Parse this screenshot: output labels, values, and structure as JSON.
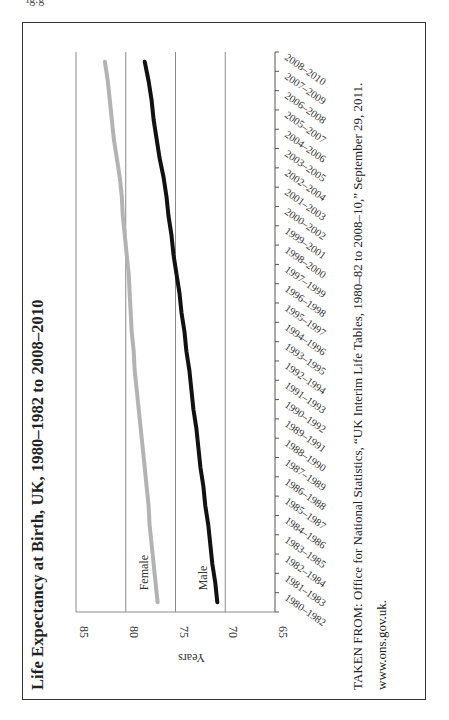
{
  "title": "Life Expectancy at Birth, UK, 1980–1982 to 2008–2010",
  "source": {
    "line1": "TAKEN FROM: Office for National Statistics, “UK Interim Life Tables, 1980–82 to 2008–10,” September 29, 2011.",
    "line2": "www.ons.gov.uk."
  },
  "top_fragment": "ig.g",
  "colors": {
    "female": "#b3b3b3",
    "male": "#111111",
    "grid": "#8a8a8a",
    "frame": "#333333"
  },
  "chart_data": {
    "type": "line",
    "title": "Life Expectancy at Birth, UK, 1980–1982 to 2008–2010",
    "xlabel": "",
    "ylabel": "Years",
    "ylim": [
      65,
      85
    ],
    "yticks": [
      65,
      70,
      75,
      80,
      85
    ],
    "grid": true,
    "orientation": "rotated -90° (x-axis runs vertically, years axis horizontal)",
    "legend": "inline labels at series start (Female, Male)",
    "categories": [
      "1980–1982",
      "1981–1983",
      "1982–1984",
      "1983–1985",
      "1984–1986",
      "1985–1987",
      "1986–1988",
      "1987–1989",
      "1988–1990",
      "1989–1991",
      "1990–1992",
      "1991–1993",
      "1992–1994",
      "1993–1995",
      "1994–1996",
      "1995–1997",
      "1996–1998",
      "1997–1999",
      "1998–2000",
      "1999–2001",
      "2000–2002",
      "2001–2003",
      "2002–2004",
      "2003–2005",
      "2004–2006",
      "2005–2007",
      "2006–2008",
      "2007–2009",
      "2008–2010"
    ],
    "series": [
      {
        "name": "Female",
        "values": [
          76.8,
          77.0,
          77.2,
          77.4,
          77.6,
          77.7,
          77.9,
          78.1,
          78.3,
          78.5,
          78.7,
          78.9,
          79.1,
          79.2,
          79.4,
          79.5,
          79.6,
          79.7,
          79.9,
          80.1,
          80.3,
          80.4,
          80.6,
          80.9,
          81.2,
          81.4,
          81.6,
          81.8,
          82.1
        ]
      },
      {
        "name": "Male",
        "values": [
          70.8,
          71.0,
          71.3,
          71.5,
          71.7,
          72.0,
          72.2,
          72.5,
          72.7,
          72.9,
          73.2,
          73.4,
          73.6,
          73.9,
          74.1,
          74.4,
          74.6,
          74.9,
          75.2,
          75.4,
          75.7,
          75.9,
          76.2,
          76.6,
          76.9,
          77.2,
          77.4,
          77.7,
          78.1
        ]
      }
    ]
  }
}
